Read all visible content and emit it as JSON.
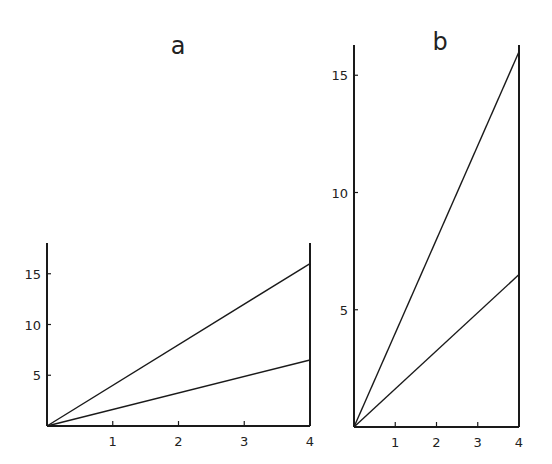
{
  "chart_data": [
    {
      "id": "a",
      "type": "line",
      "title": "a",
      "xlabel": "",
      "ylabel": "",
      "x_ticks": [
        1,
        2,
        3,
        4
      ],
      "y_ticks": [
        5,
        10,
        15
      ],
      "xlim": [
        0,
        4
      ],
      "ylim": [
        0,
        17.5
      ],
      "grid": false,
      "legend": null,
      "series": [
        {
          "name": "upper",
          "x": [
            0,
            4
          ],
          "values": [
            0,
            16
          ]
        },
        {
          "name": "lower",
          "x": [
            0,
            4
          ],
          "values": [
            0,
            6.5
          ]
        }
      ]
    },
    {
      "id": "b",
      "type": "line",
      "title": "b",
      "xlabel": "",
      "ylabel": "",
      "x_ticks": [
        1,
        2,
        3,
        4
      ],
      "y_ticks": [
        5,
        10,
        15
      ],
      "xlim": [
        0,
        4
      ],
      "ylim": [
        0,
        16.8
      ],
      "grid": false,
      "legend": null,
      "series": [
        {
          "name": "upper",
          "x": [
            0,
            4
          ],
          "values": [
            0,
            16
          ]
        },
        {
          "name": "lower",
          "x": [
            0,
            4
          ],
          "values": [
            0,
            6.5
          ]
        }
      ]
    }
  ]
}
